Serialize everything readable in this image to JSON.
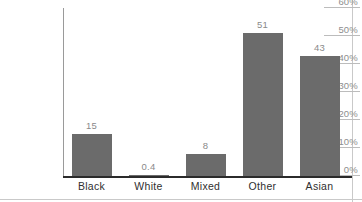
{
  "chart_data": {
    "type": "bar",
    "title": "",
    "subtitle": "",
    "xlabel": "",
    "ylabel": "",
    "categories": [
      "Black",
      "White",
      "Mixed",
      "Other",
      "Asian"
    ],
    "values": [
      15,
      0.4,
      8,
      51,
      43
    ],
    "value_labels": [
      "15",
      "0.4",
      "8",
      "51",
      "43"
    ],
    "series": [
      {
        "name": "",
        "values": [
          15,
          0.4,
          8,
          51,
          43
        ]
      }
    ],
    "ylim": [
      0,
      60
    ],
    "ytick_values": [
      0,
      10,
      20,
      30,
      40,
      50,
      60
    ],
    "ytick_labels": [
      "0%",
      "10%",
      "20%",
      "30%",
      "40%",
      "50%",
      "60%"
    ],
    "grid": false,
    "legend": null,
    "legend_position": "none",
    "bar_color": "#6b6b6b",
    "axis_color": "#2b2b2b",
    "tick_label_color": "#8e8e8e",
    "value_label_color": "#8a8a8a",
    "category_label_color": "#2f2f2f",
    "background_color": "#ffffff",
    "annotations": []
  }
}
